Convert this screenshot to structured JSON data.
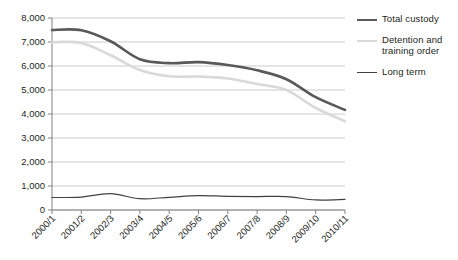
{
  "figure": {
    "clipped_heading": "",
    "background_color": "#ffffff"
  },
  "chart_data": {
    "type": "line",
    "title": "",
    "xlabel": "",
    "ylabel": "",
    "ylim": [
      0,
      8000
    ],
    "ytick_step": 1000,
    "ytick_labels": [
      "0",
      "1,000",
      "2,000",
      "3,000",
      "4,000",
      "5,000",
      "6,000",
      "7,000",
      "8,000"
    ],
    "ytick_values": [
      0,
      1000,
      2000,
      3000,
      4000,
      5000,
      6000,
      7000,
      8000
    ],
    "grid": true,
    "grid_color": "#bfbfbf",
    "legend_position": "right",
    "categories": [
      "2000/1",
      "2001/2",
      "2002/3",
      "2003/4",
      "2004/5",
      "2005/6",
      "2006/7",
      "2007/8",
      "2008/9",
      "2009/10",
      "2010/11"
    ],
    "series": [
      {
        "name": "Total custody",
        "color": "#595959",
        "width": 2.6,
        "values": [
          7500,
          7490,
          7030,
          6280,
          6120,
          6160,
          6040,
          5820,
          5450,
          4700,
          4170
        ]
      },
      {
        "name": "Detention and training order",
        "color": "#d9d9d9",
        "width": 2.6,
        "values": [
          6990,
          6960,
          6450,
          5830,
          5570,
          5560,
          5480,
          5250,
          5000,
          4250,
          3700
        ]
      },
      {
        "name": "Long term",
        "color": "#404040",
        "width": 1.2,
        "values": [
          520,
          540,
          680,
          470,
          530,
          600,
          570,
          560,
          560,
          420,
          440
        ]
      }
    ]
  },
  "legend": {
    "entries": [
      {
        "label": "Total custody",
        "color": "#595959",
        "width": 2.6
      },
      {
        "label": "Detention and training order",
        "color": "#d9d9d9",
        "width": 2.6
      },
      {
        "label": "Long term",
        "color": "#404040",
        "width": 1.4
      }
    ]
  },
  "axes": {
    "axis_color": "#808080"
  }
}
